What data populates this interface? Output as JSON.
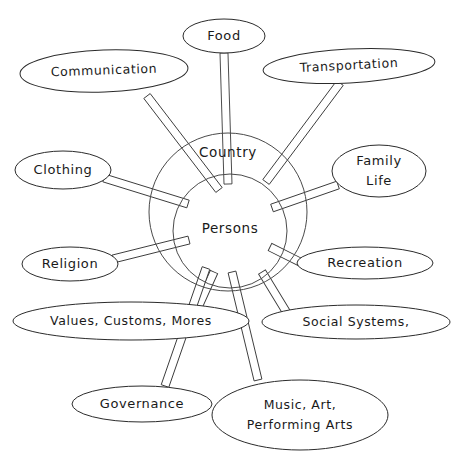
{
  "diagram": {
    "type": "radial-hub-and-spoke",
    "title": "",
    "background_color": "#ffffff",
    "line_color": "#2b2b2b",
    "text_color": "#1a1a1a",
    "core": {
      "outer_ring_label": "Country",
      "inner_ring_label": "Persons",
      "center": {
        "x": 228,
        "y": 212
      },
      "outer_radius": 79,
      "inner_center": {
        "x": 230,
        "y": 231
      },
      "inner_radius": 57
    },
    "nodes": [
      {
        "id": "food",
        "label": "Food",
        "lines": [
          "Food"
        ],
        "cx": 224,
        "cy": 36,
        "rx": 41,
        "ry": 17,
        "rotate": 0,
        "spoke": {
          "x1": 224,
          "y1": 53,
          "x2": 228,
          "y2": 184,
          "w": 8
        }
      },
      {
        "id": "communication",
        "label": "Communication",
        "lines": [
          "Communication"
        ],
        "cx": 104,
        "cy": 71,
        "rx": 84,
        "ry": 21,
        "rotate": -2,
        "spoke": {
          "x1": 147,
          "y1": 96,
          "x2": 219,
          "y2": 190,
          "w": 8
        }
      },
      {
        "id": "transportation",
        "label": "Transportation",
        "lines": [
          "Transportation"
        ],
        "cx": 349,
        "cy": 66,
        "rx": 86,
        "ry": 17,
        "rotate": -3,
        "spoke": {
          "x1": 340,
          "y1": 83,
          "x2": 266,
          "y2": 182,
          "w": 8
        }
      },
      {
        "id": "clothing",
        "label": "Clothing",
        "lines": [
          "Clothing"
        ],
        "cx": 63,
        "cy": 170,
        "rx": 48,
        "ry": 19,
        "rotate": 0,
        "spoke": {
          "x1": 104,
          "y1": 178,
          "x2": 188,
          "y2": 204,
          "w": 8
        }
      },
      {
        "id": "family-life",
        "label": "Family Life",
        "lines": [
          "Family",
          "Life"
        ],
        "cx": 379,
        "cy": 171,
        "rx": 47,
        "ry": 26,
        "rotate": 0,
        "spoke": {
          "x1": 338,
          "y1": 185,
          "x2": 272,
          "y2": 208,
          "w": 8
        }
      },
      {
        "id": "religion",
        "label": "Religion",
        "lines": [
          "Religion"
        ],
        "cx": 70,
        "cy": 264,
        "rx": 48,
        "ry": 17,
        "rotate": 0,
        "spoke": {
          "x1": 113,
          "y1": 259,
          "x2": 189,
          "y2": 240,
          "w": 8
        }
      },
      {
        "id": "recreation",
        "label": "Recreation",
        "lines": [
          "Recreation"
        ],
        "cx": 365,
        "cy": 263,
        "rx": 68,
        "ry": 16,
        "rotate": 0,
        "spoke": {
          "x1": 300,
          "y1": 262,
          "x2": 270,
          "y2": 247,
          "w": 8
        }
      },
      {
        "id": "values-customs-mores",
        "label": "Values, Customs, Mores",
        "lines": [
          "Values, Customs, Mores"
        ],
        "cx": 131,
        "cy": 321,
        "rx": 118,
        "ry": 19,
        "rotate": 0,
        "spoke": {
          "x1": 196,
          "y1": 312,
          "x2": 214,
          "y2": 272,
          "w": 8
        }
      },
      {
        "id": "social-systems",
        "label": "Social Systems,",
        "lines": [
          "Social Systems,"
        ],
        "cx": 356,
        "cy": 322,
        "rx": 94,
        "ry": 17,
        "rotate": 0,
        "spoke": {
          "x1": 290,
          "y1": 318,
          "x2": 262,
          "y2": 272,
          "w": 8
        }
      },
      {
        "id": "governance",
        "label": "Governance",
        "lines": [
          "Governance"
        ],
        "cx": 142,
        "cy": 404,
        "rx": 70,
        "ry": 18,
        "rotate": 0,
        "spoke": {
          "x1": 165,
          "y1": 386,
          "x2": 206,
          "y2": 268,
          "w": 8
        }
      },
      {
        "id": "music-art-performing-arts",
        "label": "Music, Art, Performing Arts",
        "lines": [
          "Music, Art,",
          "Performing Arts"
        ],
        "cx": 300,
        "cy": 415,
        "rx": 88,
        "ry": 35,
        "rotate": 0,
        "spoke": {
          "x1": 258,
          "y1": 380,
          "x2": 232,
          "y2": 272,
          "w": 8
        }
      }
    ]
  }
}
